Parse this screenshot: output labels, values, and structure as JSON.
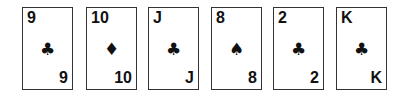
{
  "cards": [
    {
      "rank": "9",
      "suit": "clubs",
      "suit_glyph": "♣"
    },
    {
      "rank": "10",
      "suit": "diamonds",
      "suit_glyph": "♦"
    },
    {
      "rank": "J",
      "suit": "clubs",
      "suit_glyph": "♣"
    },
    {
      "rank": "8",
      "suit": "spades",
      "suit_glyph": "♠"
    },
    {
      "rank": "2",
      "suit": "clubs",
      "suit_glyph": "♣"
    },
    {
      "rank": "K",
      "suit": "clubs",
      "suit_glyph": "♣"
    }
  ]
}
